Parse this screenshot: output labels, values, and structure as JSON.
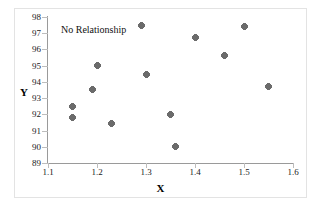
{
  "chart_data": {
    "type": "scatter",
    "title": "",
    "annotation": "No Relationship",
    "xlabel": "X",
    "ylabel": "Y",
    "xlim": [
      1.1,
      1.6
    ],
    "ylim": [
      89,
      98
    ],
    "xticks": [
      "1.1",
      "1.2",
      "1.3",
      "1.4",
      "1.5",
      "1.6"
    ],
    "xtick_values": [
      1.1,
      1.2,
      1.3,
      1.4,
      1.5,
      1.6
    ],
    "yticks": [
      "89",
      "90",
      "91",
      "92",
      "93",
      "94",
      "95",
      "96",
      "97",
      "98"
    ],
    "ytick_values": [
      89,
      90,
      91,
      92,
      93,
      94,
      95,
      96,
      97,
      98
    ],
    "grid": false,
    "legend": false,
    "marker": "diamond-plus",
    "marker_color": "#6b6b6b",
    "points": [
      {
        "x": 1.15,
        "y": 92.5
      },
      {
        "x": 1.15,
        "y": 91.8
      },
      {
        "x": 1.19,
        "y": 93.55
      },
      {
        "x": 1.2,
        "y": 95.0
      },
      {
        "x": 1.23,
        "y": 91.45
      },
      {
        "x": 1.29,
        "y": 97.45
      },
      {
        "x": 1.3,
        "y": 94.45
      },
      {
        "x": 1.35,
        "y": 92.0
      },
      {
        "x": 1.36,
        "y": 90.0
      },
      {
        "x": 1.4,
        "y": 96.75
      },
      {
        "x": 1.46,
        "y": 95.6
      },
      {
        "x": 1.5,
        "y": 97.4
      },
      {
        "x": 1.55,
        "y": 93.7
      }
    ]
  },
  "figure": {
    "caption": ""
  }
}
